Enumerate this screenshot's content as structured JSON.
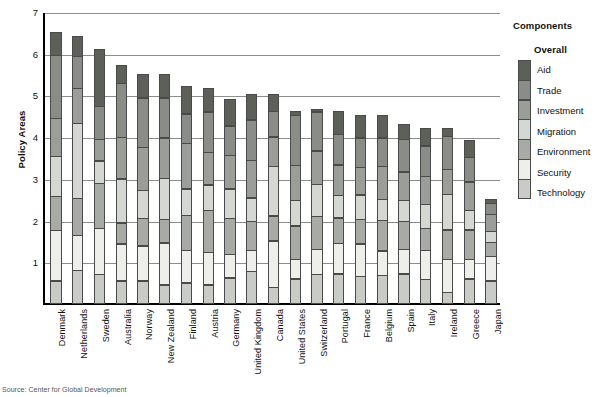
{
  "chart_data": {
    "type": "bar",
    "subtype": "stacked-bar",
    "title": "",
    "xlabel": "",
    "ylabel": "Policy Areas",
    "ylim": [
      0,
      7
    ],
    "yticks": [
      1,
      2,
      3,
      4,
      5,
      6,
      7
    ],
    "grid": true,
    "legend_position": "right",
    "legend_title": "Components",
    "legend_subtitle": "Overall",
    "categories": [
      "Denmark",
      "Netherlands",
      "Sweden",
      "Australia",
      "Norway",
      "New Zealand",
      "Finland",
      "Austria",
      "Germany",
      "United Kingdom",
      "Canada",
      "United States",
      "Switzerland",
      "Portugal",
      "France",
      "Belgium",
      "Spain",
      "Italy",
      "Ireland",
      "Greece",
      "Japan"
    ],
    "series": [
      {
        "name": "Technology",
        "color": "#c9cbc6",
        "values": [
          0.55,
          0.8,
          0.7,
          0.55,
          0.55,
          0.45,
          0.5,
          0.45,
          0.62,
          0.78,
          0.4,
          0.6,
          0.7,
          0.72,
          0.65,
          0.68,
          0.72,
          0.58,
          0.28,
          0.6,
          0.55
        ]
      },
      {
        "name": "Security",
        "color": "#eeeeea",
        "values": [
          1.22,
          0.85,
          1.12,
          0.9,
          0.85,
          1.02,
          0.8,
          0.8,
          0.58,
          0.52,
          1.12,
          0.48,
          0.62,
          0.74,
          0.8,
          0.6,
          0.6,
          0.72,
          0.8,
          0.48,
          0.6
        ]
      },
      {
        "name": "Environment",
        "color": "#a8aaa5",
        "values": [
          0.83,
          0.9,
          1.1,
          0.52,
          0.68,
          0.58,
          0.85,
          1.02,
          0.88,
          0.7,
          0.62,
          0.82,
          0.8,
          0.63,
          0.6,
          0.75,
          0.68,
          0.53,
          0.72,
          0.72,
          0.35
        ]
      },
      {
        "name": "Migration",
        "color": "#d5d7d2",
        "values": [
          0.98,
          1.82,
          0.55,
          1.07,
          0.68,
          1.0,
          0.65,
          0.62,
          0.72,
          0.58,
          1.2,
          0.62,
          0.78,
          0.55,
          0.6,
          0.52,
          0.52,
          0.6,
          0.86,
          0.48,
          0.28
        ]
      },
      {
        "name": "Investment",
        "color": "#9b9e98",
        "values": [
          0.92,
          0.85,
          0.53,
          1.0,
          1.05,
          0.98,
          1.1,
          0.8,
          0.82,
          0.92,
          0.72,
          0.85,
          0.82,
          0.75,
          0.68,
          0.8,
          0.7,
          0.68,
          0.62,
          0.7,
          0.42
        ]
      },
      {
        "name": "Trade",
        "color": "#8a8d87",
        "values": [
          1.52,
          0.78,
          0.8,
          1.32,
          1.2,
          0.98,
          0.72,
          0.98,
          0.72,
          0.98,
          0.62,
          1.22,
          0.95,
          0.75,
          0.72,
          0.7,
          0.8,
          0.75,
          0.8,
          0.6,
          0.28
        ]
      },
      {
        "name": "Aid",
        "color": "#5c6058",
        "values": [
          0.58,
          0.5,
          1.4,
          0.44,
          0.59,
          0.59,
          0.68,
          0.58,
          0.66,
          0.62,
          0.42,
          0.11,
          0.08,
          0.56,
          0.55,
          0.55,
          0.38,
          0.44,
          0.22,
          0.42,
          0.12
        ]
      }
    ],
    "totals": [
      6.6,
      6.5,
      6.2,
      5.8,
      5.6,
      5.6,
      5.3,
      5.25,
      5.0,
      5.1,
      5.1,
      4.7,
      4.75,
      4.7,
      4.6,
      4.6,
      4.4,
      4.3,
      4.3,
      4.0,
      2.6
    ]
  },
  "legend": {
    "title": "Components",
    "subtitle": "Overall",
    "items": [
      {
        "label": "Aid",
        "color": "#5c6058"
      },
      {
        "label": "Trade",
        "color": "#8a8d87"
      },
      {
        "label": "Investment",
        "color": "#9b9e98"
      },
      {
        "label": "Migration",
        "color": "#d5d7d2"
      },
      {
        "label": "Environment",
        "color": "#a8aaa5"
      },
      {
        "label": "Security",
        "color": "#eeeeea"
      },
      {
        "label": "Technology",
        "color": "#c9cbc6"
      }
    ]
  },
  "axes": {
    "y_title": "Policy Areas",
    "y_ticks": [
      "7",
      "6",
      "5",
      "4",
      "3",
      "2",
      "1"
    ]
  },
  "footer": {
    "source": "Source: Center for Global Development"
  }
}
